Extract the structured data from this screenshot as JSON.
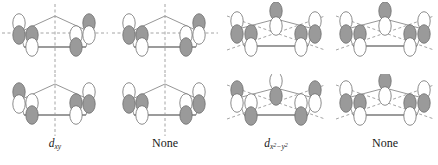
{
  "figure": {
    "background": "#ffffff",
    "colors": {
      "lobe_shaded": "#9a9a9a",
      "lobe_shaded_stroke": "#6f6f6f",
      "lobe_white": "#ffffff",
      "lobe_white_stroke": "#6f6f6f",
      "ring_line": "#8a8a8a",
      "ring_base_line": "#7a7a7a",
      "mirror_dash": "#9a9a9a",
      "text": "#1a1a1a"
    },
    "columns": [
      {
        "id": "column-1",
        "caption_kind": "d-orbital",
        "caption_base": "d",
        "caption_sub": "xy",
        "caption_text": "dxy",
        "mirror_lines": [
          "vertical",
          "horizontal"
        ],
        "panels": [
          {
            "id": "panel-1-top",
            "position": "top"
          },
          {
            "id": "panel-1-bottom",
            "position": "bottom"
          }
        ]
      },
      {
        "id": "column-2",
        "caption_kind": "none",
        "caption_text": "None",
        "mirror_lines": [
          "vertical",
          "horizontal"
        ],
        "panels": [
          {
            "id": "panel-2-top",
            "position": "top"
          },
          {
            "id": "panel-2-bottom",
            "position": "bottom"
          }
        ]
      },
      {
        "id": "column-3",
        "caption_kind": "d-orbital",
        "caption_base": "d",
        "caption_sub_html": "x2-y2",
        "caption_text": "dx2-y2",
        "mirror_lines": [
          "diagonal-up",
          "diagonal-down"
        ],
        "panels": [
          {
            "id": "panel-3-top",
            "position": "top"
          },
          {
            "id": "panel-3-bottom",
            "position": "bottom"
          }
        ]
      },
      {
        "id": "column-4",
        "caption_kind": "none",
        "caption_text": "None",
        "mirror_lines": [
          "diagonal-up",
          "diagonal-down"
        ],
        "panels": [
          {
            "id": "panel-4-top",
            "position": "top"
          },
          {
            "id": "panel-4-bottom",
            "position": "bottom"
          }
        ]
      }
    ],
    "captions": {
      "col1": "d",
      "col1_sub": "xy",
      "col2": "None",
      "col3": "d",
      "col3_sub_x": "x",
      "col3_sub_exp1": "2",
      "col3_sub_minus": "−",
      "col3_sub_y": "y",
      "col3_sub_exp2": "2",
      "col4": "None"
    }
  }
}
